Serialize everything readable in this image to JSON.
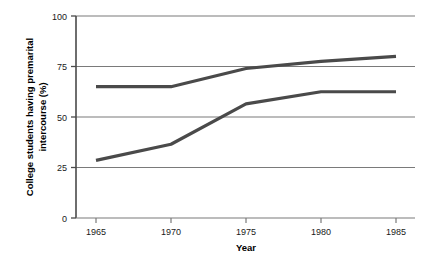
{
  "chart_data": {
    "type": "line",
    "title": "",
    "xlabel": "Year",
    "ylabel": "College students having premarital intercourse (%)",
    "ylabel_line1": "College students having premarital",
    "ylabel_line2": "intercourse (%)",
    "x": [
      1965,
      1970,
      1975,
      1980,
      1985
    ],
    "xticklabels": [
      "1965",
      "1970",
      "1975",
      "1980",
      "1985"
    ],
    "xlim": [
      1963.5,
      1987.5
    ],
    "ylim": [
      0,
      100
    ],
    "yticks": [
      0,
      25,
      50,
      75,
      100
    ],
    "yticklabels": [
      "0",
      "25",
      "50",
      "75",
      "100"
    ],
    "grid": "horizontal",
    "legend": "none",
    "series": [
      {
        "name": "upper-series",
        "values": [
          65,
          65,
          74,
          77.5,
          80
        ],
        "color": "#4a4a4a"
      },
      {
        "name": "lower-series",
        "values": [
          28.5,
          36.5,
          56.5,
          62.5,
          62.5
        ],
        "color": "#4a4a4a"
      }
    ],
    "colors": {
      "line": "#4a4a4a",
      "grid": "#7a7a7a",
      "axis": "#4a4a4a",
      "text": "#000000",
      "background": "#ffffff"
    }
  }
}
